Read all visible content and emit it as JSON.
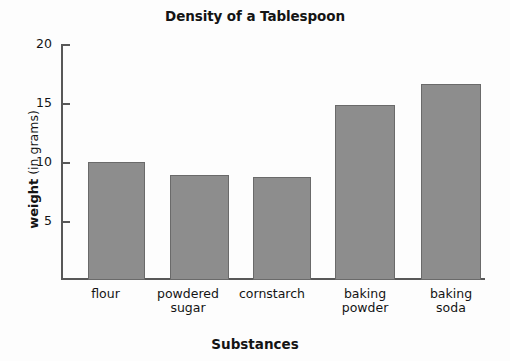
{
  "chart_data": {
    "type": "bar",
    "title": "Density of a Tablespoon",
    "xlabel": "Substances",
    "ylabel": "weight (in grams)",
    "ylabel_bold_part": "weight",
    "ylabel_regular_part": " (in grams)",
    "categories": [
      "flour",
      "powdered sugar",
      "cornstarch",
      "baking powder",
      "baking soda"
    ],
    "category_lines": [
      [
        "flour"
      ],
      [
        "powdered",
        "sugar"
      ],
      [
        "cornstarch"
      ],
      [
        "baking",
        "powder"
      ],
      [
        "baking",
        "soda"
      ]
    ],
    "values": [
      10,
      8.9,
      8.7,
      14.8,
      16.6
    ],
    "ylim": [
      0,
      20
    ],
    "yticks": [
      5,
      10,
      15,
      20
    ],
    "ytick_labels": [
      "5",
      "10",
      "15",
      "20"
    ],
    "grid": false,
    "legend": false,
    "bar_color": "#8d8d8d",
    "bar_edge_color": "#6a6a6a",
    "axis_color": "#585858",
    "background": "#fdfdfd"
  }
}
